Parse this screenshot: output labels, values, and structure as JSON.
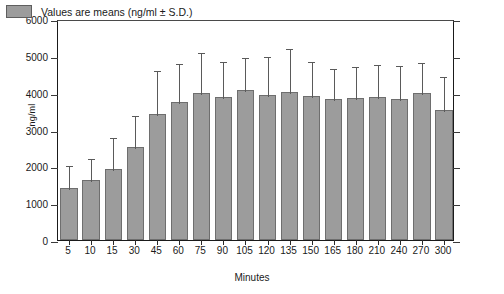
{
  "chart_data": {
    "type": "bar",
    "title": "",
    "xlabel": "Minutes",
    "ylabel": "ng/ml",
    "ylim": [
      0,
      6000
    ],
    "yticks": [
      0,
      1000,
      2000,
      3000,
      4000,
      5000,
      6000
    ],
    "ytick_labels": [
      "0",
      "1000",
      "2000",
      "3000",
      "4000",
      "5000",
      "6000"
    ],
    "grid": false,
    "legend_position": "top-left",
    "legend": [
      "Values are means (ng/ml ± S.D.)"
    ],
    "error_bars": "upper-only S.D. whiskers with caps",
    "categories": [
      "5",
      "10",
      "15",
      "30",
      "45",
      "60",
      "75",
      "90",
      "105",
      "120",
      "135",
      "150",
      "165",
      "180",
      "210",
      "240",
      "270",
      "300"
    ],
    "values": [
      1400,
      1620,
      1930,
      2530,
      3420,
      3740,
      3980,
      3880,
      4080,
      3930,
      4020,
      3900,
      3840,
      3850,
      3880,
      3840,
      3980,
      3530
    ],
    "error_upper": [
      2070,
      2250,
      2820,
      3430,
      4640,
      4820,
      5140,
      4900,
      5000,
      5030,
      5230,
      4900,
      4700,
      4750,
      4800,
      4790,
      4870,
      4480
    ],
    "series": [
      {
        "name": "Values are means (ng/ml ± S.D.)",
        "values": [
          1400,
          1620,
          1930,
          2530,
          3420,
          3740,
          3980,
          3880,
          4080,
          3930,
          4020,
          3900,
          3840,
          3850,
          3880,
          3840,
          3980,
          3530
        ]
      }
    ],
    "colors": {
      "bar_fill": "#9c9c9c",
      "bar_edge": "#6e6e6e",
      "error_bar": "#5a5a5a",
      "axis": "#1a1a1a",
      "text": "#1a1a1a",
      "background": "#ffffff"
    }
  },
  "legend": {
    "label": "Values are means (ng/ml ± S.D.)"
  },
  "axes": {
    "x_title": "Minutes",
    "y_title": "ng/ml"
  }
}
